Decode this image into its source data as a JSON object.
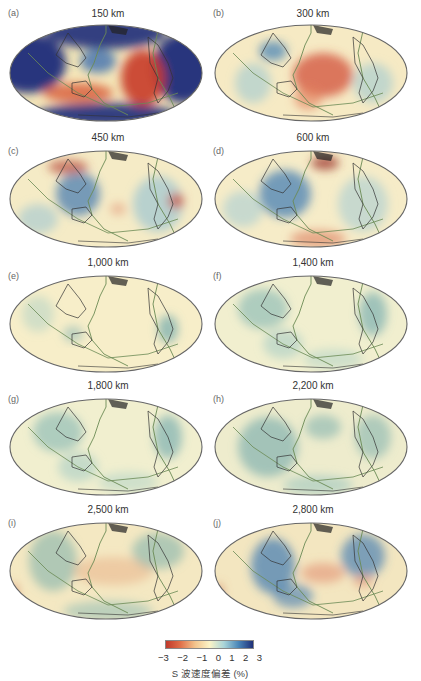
{
  "figure": {
    "panels": [
      {
        "letter": "(a)",
        "depth": "150 km",
        "style": "strong"
      },
      {
        "letter": "(b)",
        "depth": "300 km",
        "style": "red-center"
      },
      {
        "letter": "(c)",
        "depth": "450 km",
        "style": "mixed"
      },
      {
        "letter": "(d)",
        "depth": "600 km",
        "style": "mixed-blue-west"
      },
      {
        "letter": "(e)",
        "depth": "1,000 km",
        "style": "pale"
      },
      {
        "letter": "(f)",
        "depth": "1,400 km",
        "style": "pale-green"
      },
      {
        "letter": "(g)",
        "depth": "1,800 km",
        "style": "pale-green"
      },
      {
        "letter": "(h)",
        "depth": "2,200 km",
        "style": "teal"
      },
      {
        "letter": "(i)",
        "depth": "2,500 km",
        "style": "teal-warm-center"
      },
      {
        "letter": "(j)",
        "depth": "2,800 km",
        "style": "blue-ring"
      }
    ],
    "colorbar": {
      "ticks": [
        "−3",
        "−2",
        "−1",
        "0",
        "1",
        "2",
        "3"
      ],
      "label": "S 波速度偏差 (%)",
      "colors": [
        "#c0392b",
        "#e0704a",
        "#f2c38c",
        "#fbf3c6",
        "#a9d4d8",
        "#4a86b8",
        "#1f2f78"
      ]
    }
  },
  "chart_data": {
    "type": "heatmap",
    "title": "",
    "subplots": [
      "150 km",
      "300 km",
      "450 km",
      "600 km",
      "1,000 km",
      "1,400 km",
      "1,800 km",
      "2,200 km",
      "2,500 km",
      "2,800 km"
    ],
    "projection": "Hammer/Mollweide global map, Pacific-centered",
    "colorbar": {
      "label": "S 波速度偏差 (%)",
      "range": [
        -3,
        3
      ],
      "ticks": [
        -3,
        -2,
        -1,
        0,
        1,
        2,
        3
      ],
      "low_color": "red (slow)",
      "high_color": "blue (fast)"
    },
    "overlays": [
      "coastlines",
      "plate boundaries (green)"
    ]
  }
}
